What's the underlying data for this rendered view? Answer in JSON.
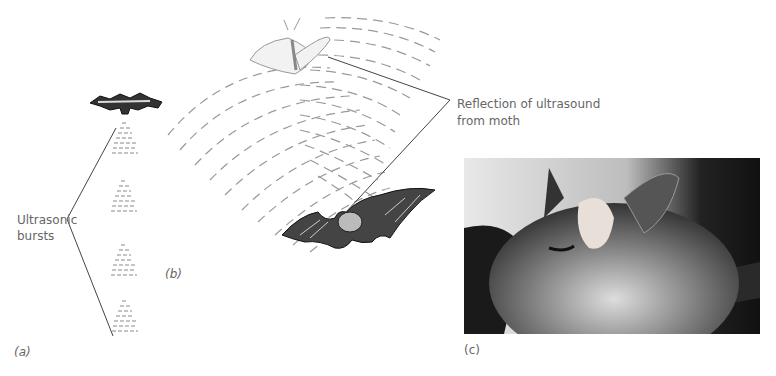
{
  "labels": {
    "ultrasonic": "Ultrasonic",
    "bursts": "bursts",
    "reflection_line1": "Reflection of ultrasound",
    "reflection_line2": "from moth",
    "panel_a": "(a)",
    "panel_b": "(b)",
    "panel_c": "(c)"
  },
  "elements": {
    "top_bat": "bat-illustration",
    "moth": "moth-illustration",
    "hunting_bat": "bat-illustration",
    "photo": "bat-face-photo"
  },
  "colors": {
    "wave": "#888888",
    "line": "#444444",
    "text": "#666666"
  }
}
